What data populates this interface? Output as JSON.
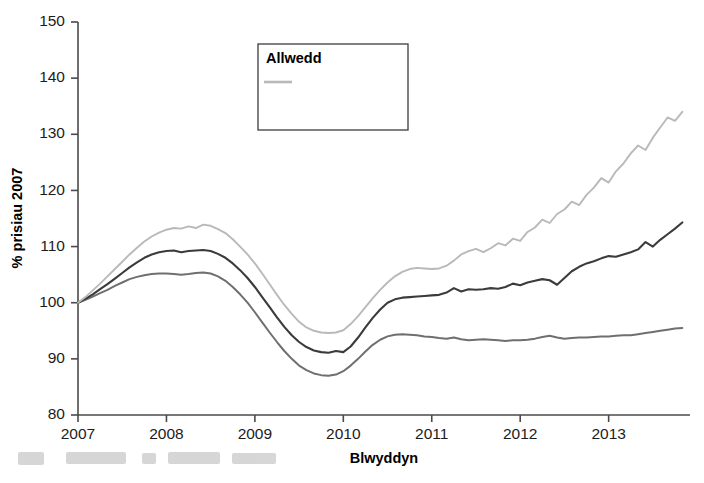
{
  "chart_data": {
    "type": "line",
    "title": "",
    "xlabel": "Blwyddyn",
    "ylabel": "% prisiau 2007",
    "xlim": [
      2007.0,
      2013.92
    ],
    "ylim": [
      80,
      150
    ],
    "yticks": [
      80,
      90,
      100,
      110,
      120,
      130,
      140,
      150
    ],
    "xticks": [
      2007,
      2008,
      2009,
      2010,
      2011,
      2012,
      2013
    ],
    "xtick_labels": [
      "2007",
      "2008",
      "2009",
      "2010",
      "2011",
      "2012",
      "2013"
    ],
    "ytick_labels": [
      "80",
      "90",
      "100",
      "110",
      "120",
      "130",
      "140",
      "150"
    ],
    "grid": false,
    "legend_position": "top-center",
    "legend_title": "Allwedd",
    "x": [
      2007.0,
      2007.083,
      2007.167,
      2007.25,
      2007.333,
      2007.417,
      2007.5,
      2007.583,
      2007.667,
      2007.75,
      2007.833,
      2007.917,
      2008.0,
      2008.083,
      2008.167,
      2008.25,
      2008.333,
      2008.417,
      2008.5,
      2008.583,
      2008.667,
      2008.75,
      2008.833,
      2008.917,
      2009.0,
      2009.083,
      2009.167,
      2009.25,
      2009.333,
      2009.417,
      2009.5,
      2009.583,
      2009.667,
      2009.75,
      2009.833,
      2009.917,
      2010.0,
      2010.083,
      2010.167,
      2010.25,
      2010.333,
      2010.417,
      2010.5,
      2010.583,
      2010.667,
      2010.75,
      2010.833,
      2010.917,
      2011.0,
      2011.083,
      2011.167,
      2011.25,
      2011.333,
      2011.417,
      2011.5,
      2011.583,
      2011.667,
      2011.75,
      2011.833,
      2011.917,
      2012.0,
      2012.083,
      2012.167,
      2012.25,
      2012.333,
      2012.417,
      2012.5,
      2012.583,
      2012.667,
      2012.75,
      2012.833,
      2012.917,
      2013.0,
      2013.083,
      2013.167,
      2013.25,
      2013.333,
      2013.417,
      2013.5,
      2013.583,
      2013.667,
      2013.75,
      2013.833
    ],
    "series": [
      {
        "name": "Llundain Fewnol",
        "color": "#b9b9b9",
        "width": 1.9,
        "values": [
          100.0,
          101.0,
          102.2,
          103.4,
          104.7,
          106.0,
          107.3,
          108.6,
          109.8,
          110.9,
          111.8,
          112.5,
          113.0,
          113.3,
          113.2,
          113.6,
          113.3,
          113.9,
          113.7,
          113.1,
          112.4,
          111.3,
          110.0,
          108.6,
          107.0,
          105.2,
          103.3,
          101.4,
          99.6,
          98.0,
          96.6,
          95.6,
          95.0,
          94.7,
          94.6,
          94.7,
          95.1,
          96.2,
          97.6,
          99.2,
          100.8,
          102.3,
          103.6,
          104.7,
          105.5,
          106.0,
          106.2,
          106.1,
          106.0,
          106.1,
          106.6,
          107.5,
          108.6,
          109.2,
          109.6,
          109.0,
          109.7,
          110.6,
          110.2,
          111.4,
          111.0,
          112.6,
          113.4,
          114.8,
          114.2,
          115.8,
          116.6,
          118.0,
          117.4,
          119.2,
          120.5,
          122.2,
          121.4,
          123.4,
          124.8,
          126.6,
          128.0,
          127.2,
          129.4,
          131.2,
          133.0,
          132.4,
          134.0
        ]
      },
      {
        "name": "Llundain Allanol",
        "color": "#3b3b3b",
        "width": 2.1,
        "values": [
          100.0,
          100.7,
          101.5,
          102.4,
          103.3,
          104.3,
          105.3,
          106.3,
          107.2,
          108.0,
          108.6,
          109.0,
          109.2,
          109.3,
          109.0,
          109.2,
          109.3,
          109.4,
          109.2,
          108.7,
          108.0,
          107.0,
          105.8,
          104.4,
          102.8,
          101.0,
          99.2,
          97.4,
          95.7,
          94.2,
          93.0,
          92.1,
          91.5,
          91.2,
          91.1,
          91.4,
          91.2,
          92.2,
          93.8,
          95.6,
          97.3,
          98.8,
          100.0,
          100.6,
          100.9,
          101.0,
          101.1,
          101.2,
          101.3,
          101.4,
          101.8,
          102.6,
          102.0,
          102.4,
          102.3,
          102.4,
          102.6,
          102.5,
          102.8,
          103.4,
          103.1,
          103.6,
          103.9,
          104.2,
          104.0,
          103.2,
          104.4,
          105.6,
          106.4,
          107.0,
          107.4,
          107.9,
          108.3,
          108.2,
          108.6,
          109.0,
          109.5,
          110.8,
          110.0,
          111.2,
          112.2,
          113.2,
          114.3
        ]
      },
      {
        "name": "Cymru a Lloegr",
        "color": "#6f6f6f",
        "width": 2.0,
        "values": [
          100.0,
          100.5,
          101.1,
          101.7,
          102.3,
          103.0,
          103.6,
          104.2,
          104.6,
          104.9,
          105.1,
          105.2,
          105.2,
          105.1,
          105.0,
          105.1,
          105.3,
          105.4,
          105.2,
          104.7,
          103.9,
          102.8,
          101.5,
          100.0,
          98.3,
          96.5,
          94.7,
          93.0,
          91.4,
          90.0,
          88.8,
          88.0,
          87.4,
          87.1,
          87.0,
          87.2,
          87.8,
          88.8,
          90.0,
          91.3,
          92.5,
          93.4,
          94.0,
          94.3,
          94.4,
          94.3,
          94.2,
          94.0,
          93.9,
          93.7,
          93.6,
          93.8,
          93.5,
          93.3,
          93.4,
          93.5,
          93.4,
          93.3,
          93.2,
          93.3,
          93.3,
          93.4,
          93.6,
          93.9,
          94.1,
          93.8,
          93.6,
          93.7,
          93.8,
          93.8,
          93.9,
          94.0,
          94.0,
          94.1,
          94.2,
          94.2,
          94.4,
          94.6,
          94.8,
          95.0,
          95.2,
          95.4,
          95.5
        ]
      }
    ]
  },
  "axes": {
    "x_title": "Blwyddyn",
    "y_title": "% prisiau 2007"
  },
  "legend": {
    "title": "Allwedd",
    "entries": [
      {
        "label": "Llundain Fewnol"
      },
      {
        "label": "Llundain Allanol"
      },
      {
        "label": "Cymru a Lloegr"
      }
    ]
  }
}
